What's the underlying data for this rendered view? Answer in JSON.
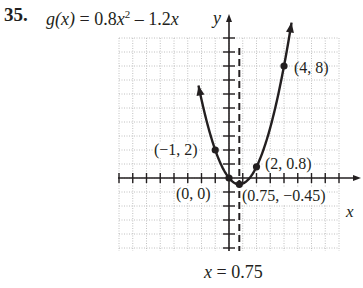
{
  "problem": {
    "number": "35."
  },
  "function": {
    "name": "g(x)",
    "equals": " = 0.8",
    "var": "x",
    "exp": "2",
    "rest": " – 1.2",
    "var2": "x"
  },
  "axes": {
    "x_label": "x",
    "y_label": "y"
  },
  "axis_of_symmetry": {
    "var": "x",
    "label": " = 0.75"
  },
  "points": [
    {
      "label": "(4, 8)"
    },
    {
      "label": "(−1, 2)"
    },
    {
      "label": "(2, 0.8)"
    },
    {
      "label": "(0, 0)"
    },
    {
      "label": "(0.75, −0.45)"
    }
  ],
  "chart_data": {
    "type": "line",
    "xlabel": "x",
    "ylabel": "y",
    "xlim": [
      -8,
      8
    ],
    "ylim": [
      -5,
      10
    ],
    "grid": true,
    "series": [
      {
        "name": "g(x) = 0.8x^2 - 1.2x",
        "x": [
          -2.2,
          -2,
          -1,
          0,
          0.75,
          1,
          2,
          3,
          4,
          4.6
        ],
        "y": [
          6.51,
          5.6,
          2,
          0,
          -0.45,
          -0.4,
          0.8,
          3.6,
          8,
          11.41
        ]
      }
    ],
    "labeled_points": [
      {
        "x": -1,
        "y": 2,
        "label": "(-1, 2)"
      },
      {
        "x": 0,
        "y": 0,
        "label": "(0, 0)"
      },
      {
        "x": 0.75,
        "y": -0.45,
        "label": "(0.75, -0.45)",
        "note": "vertex"
      },
      {
        "x": 2,
        "y": 0.8,
        "label": "(2, 0.8)"
      },
      {
        "x": 4,
        "y": 8,
        "label": "(4, 8)"
      }
    ],
    "annotations": [
      {
        "type": "vertical-dashed-line",
        "x": 0.75,
        "label": "x = 0.75"
      }
    ]
  }
}
